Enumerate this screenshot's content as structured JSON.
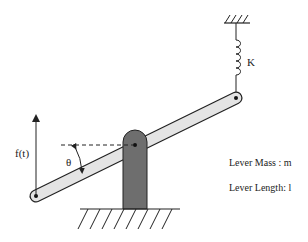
{
  "diagram": {
    "labels": {
      "spring_constant": "K",
      "force": "f(t)",
      "angle": "θ",
      "lever_mass": "Lever Mass : m",
      "lever_length": "Lever Length: l"
    },
    "colors": {
      "lever_fill": "#e4e4e4",
      "fulcrum_fill": "#6e6e6e",
      "line": "#222222"
    }
  }
}
